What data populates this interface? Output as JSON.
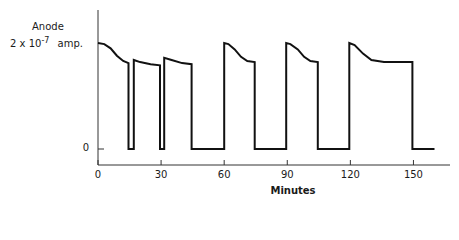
{
  "chart_data": {
    "type": "line",
    "title": "",
    "ylabel_line1": "Anode",
    "ylabel_line2_prefix": "2 x 10",
    "ylabel_exponent": "-7",
    "ylabel_line2_suffix": "amp.",
    "xlabel": "Minutes",
    "x_ticks": [
      0,
      30,
      60,
      90,
      120,
      150
    ],
    "x_tick_labels": [
      "0",
      "30",
      "60",
      "90",
      "120",
      "150"
    ],
    "y_ticks": [
      0
    ],
    "y_tick_labels": [
      "0"
    ],
    "xlim": [
      0,
      162
    ],
    "ylim": [
      -0.15,
      1.1
    ],
    "grid": false,
    "legend": null,
    "series": [
      {
        "name": "Anode current",
        "points": [
          [
            0,
            1.0
          ],
          [
            3,
            0.99
          ],
          [
            6,
            0.95
          ],
          [
            9,
            0.88
          ],
          [
            12,
            0.83
          ],
          [
            14.5,
            0.81
          ],
          [
            14.5,
            0
          ],
          [
            17,
            0
          ],
          [
            17,
            0.84
          ],
          [
            20,
            0.82
          ],
          [
            25,
            0.8
          ],
          [
            29.5,
            0.79
          ],
          [
            29.5,
            0
          ],
          [
            31.5,
            0
          ],
          [
            31.5,
            0.86
          ],
          [
            35,
            0.84
          ],
          [
            40,
            0.81
          ],
          [
            44.5,
            0.8
          ],
          [
            44.5,
            0
          ],
          [
            60,
            0
          ],
          [
            60,
            1.0
          ],
          [
            62,
            0.99
          ],
          [
            65,
            0.94
          ],
          [
            68,
            0.87
          ],
          [
            71,
            0.83
          ],
          [
            74.5,
            0.82
          ],
          [
            74.5,
            0
          ],
          [
            89.5,
            0
          ],
          [
            89.5,
            1.0
          ],
          [
            91.5,
            0.99
          ],
          [
            95,
            0.94
          ],
          [
            98,
            0.87
          ],
          [
            101,
            0.83
          ],
          [
            104.5,
            0.82
          ],
          [
            104.5,
            0
          ],
          [
            119.5,
            0
          ],
          [
            119.5,
            1.0
          ],
          [
            122,
            0.98
          ],
          [
            126,
            0.9
          ],
          [
            130,
            0.84
          ],
          [
            136,
            0.82
          ],
          [
            144,
            0.82
          ],
          [
            149.5,
            0.82
          ],
          [
            149.5,
            0
          ],
          [
            160,
            0
          ]
        ]
      }
    ]
  }
}
